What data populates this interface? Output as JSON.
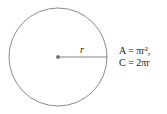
{
  "diagram": {
    "shape": "circle",
    "radius_label": "r",
    "formulas": {
      "area": "A = πr²,",
      "circumference": "C = 2πr"
    },
    "colors": {
      "circle_stroke": "#888888",
      "radius_line": "#666666",
      "center_dot": "#777777"
    }
  }
}
